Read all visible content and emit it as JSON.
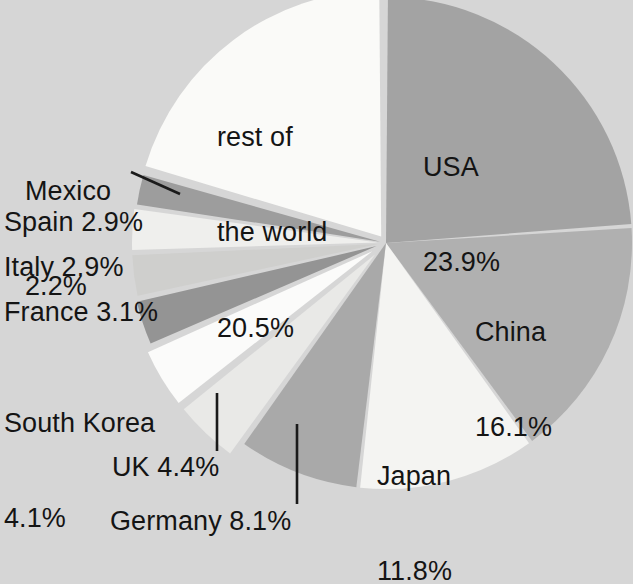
{
  "chart_data": {
    "type": "pie",
    "title": "",
    "subtitle": "",
    "xlabel": "",
    "ylabel": "",
    "legend": "none",
    "grid": false,
    "units": "percent",
    "categories": [
      "USA",
      "China",
      "Japan",
      "Germany",
      "UK",
      "South Korea",
      "France",
      "Italy",
      "Spain",
      "Mexico",
      "rest of the world"
    ],
    "values": [
      23.9,
      16.1,
      11.8,
      8.1,
      4.4,
      4.1,
      3.1,
      2.9,
      2.9,
      2.2,
      20.5
    ],
    "slices": [
      {
        "name": "USA",
        "label": "USA",
        "value_label": "23.9%",
        "value": 23.9,
        "color": "#a3a3a3",
        "label_position": "inside"
      },
      {
        "name": "China",
        "label": "China",
        "value_label": "16.1%",
        "value": 16.1,
        "color": "#b0b0b0",
        "label_position": "inside"
      },
      {
        "name": "Japan",
        "label": "Japan",
        "value_label": "11.8%",
        "value": 11.8,
        "color": "#f4f4f2",
        "label_position": "inside"
      },
      {
        "name": "Germany",
        "label": "Germany",
        "value_label": "8.1%",
        "value": 8.1,
        "color": "#a9a9a9",
        "label_position": "outside",
        "leader_line": true
      },
      {
        "name": "UK",
        "label": "UK",
        "value_label": "4.4%",
        "value": 4.4,
        "color": "#e9e9e7",
        "label_position": "outside",
        "leader_line": true
      },
      {
        "name": "South Korea",
        "label": "South Korea",
        "value_label": "4.1%",
        "value": 4.1,
        "color": "#fbfbfa",
        "label_position": "outside",
        "leader_line": false
      },
      {
        "name": "France",
        "label": "France",
        "value_label": "3.1%",
        "value": 3.1,
        "color": "#949494",
        "label_position": "outside",
        "leader_line": false
      },
      {
        "name": "Italy",
        "label": "Italy",
        "value_label": "2.9%",
        "value": 2.9,
        "color": "#cfcfcd",
        "label_position": "outside",
        "leader_line": false
      },
      {
        "name": "Spain",
        "label": "Spain",
        "value_label": "2.9%",
        "value": 2.9,
        "color": "#efefed",
        "label_position": "outside",
        "leader_line": false
      },
      {
        "name": "Mexico",
        "label": "Mexico",
        "value_label": "2.2%",
        "value": 2.2,
        "color": "#9d9d9d",
        "label_position": "outside",
        "leader_line": true
      },
      {
        "name": "rest of the world",
        "label": "rest of\nthe world",
        "value_label": "20.5%",
        "value": 20.5,
        "color": "#fafaf8",
        "label_position": "inside"
      }
    ],
    "background_color": "#d6d6d6",
    "text_color": "#141414"
  },
  "labels": {
    "usa": "USA",
    "usa_value": "23.9%",
    "china": "China",
    "china_value": "16.1%",
    "japan": "Japan",
    "japan_value": "11.8%",
    "rest_line1": "rest of",
    "rest_line2": "the world",
    "rest_value": "20.5%",
    "germany": "Germany 8.1%",
    "uk": "UK 4.4%",
    "south_korea_line1": "South Korea",
    "south_korea_line2": "4.1%",
    "france": "France 3.1%",
    "italy": "Italy 2.9%",
    "spain": "Spain 2.9%",
    "mexico_line1": "Mexico",
    "mexico_line2": "2.2%"
  }
}
